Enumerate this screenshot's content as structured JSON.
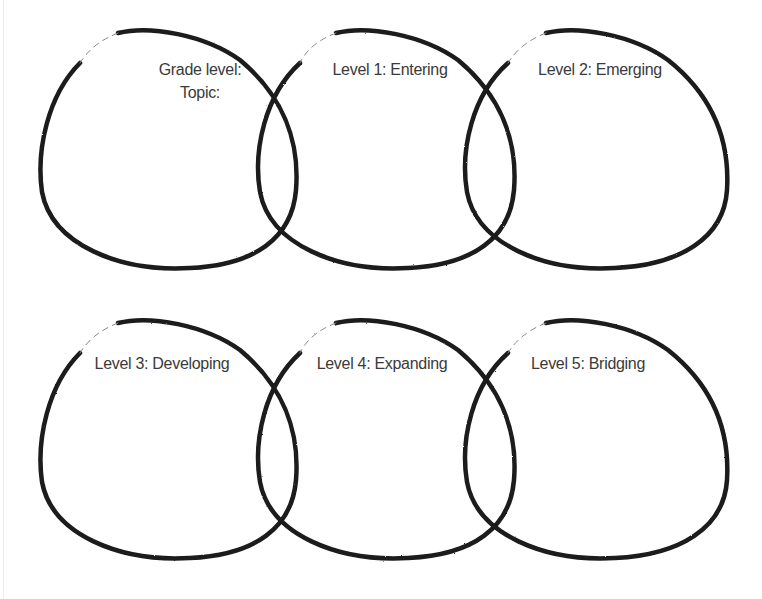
{
  "diagram": {
    "type": "overlapping-circle-organizer",
    "stroke_color": "#1a1a1a",
    "rows": [
      {
        "circles": [
          {
            "id": "header",
            "lines": [
              "Grade level:",
              "Topic:"
            ]
          },
          {
            "id": "level-1",
            "lines": [
              "Level 1: Entering"
            ]
          },
          {
            "id": "level-2",
            "lines": [
              "Level 2: Emerging"
            ]
          }
        ]
      },
      {
        "circles": [
          {
            "id": "level-3",
            "lines": [
              "Level 3: Developing"
            ]
          },
          {
            "id": "level-4",
            "lines": [
              "Level 4: Expanding"
            ]
          },
          {
            "id": "level-5",
            "lines": [
              "Level 5: Bridging"
            ]
          }
        ]
      }
    ]
  }
}
